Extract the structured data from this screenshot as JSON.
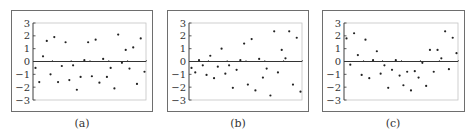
{
  "chart_data": [
    {
      "type": "scatter",
      "title": "",
      "caption": "(a)",
      "xlabel": "",
      "ylabel": "",
      "ylim": [
        -3,
        3
      ],
      "yticks": [
        3,
        2,
        1,
        0,
        -1,
        -2,
        -3
      ],
      "ytick_labels": [
        "3",
        "2",
        "1",
        "0",
        "−1",
        "−2",
        "−3"
      ],
      "x": [
        1,
        2,
        3,
        4,
        5,
        6,
        7,
        8,
        9,
        10,
        11,
        12,
        13,
        14,
        15,
        16,
        17,
        18,
        19,
        20,
        21,
        22,
        23,
        24,
        25,
        26,
        27,
        28,
        29,
        30
      ],
      "values": [
        -0.5,
        -1.6,
        0.4,
        1.6,
        -1.0,
        1.9,
        -1.6,
        -0.35,
        1.5,
        -1.45,
        -0.3,
        -2.2,
        -1.2,
        0.1,
        1.5,
        -1.15,
        1.7,
        -1.65,
        0.2,
        -1.2,
        -0.5,
        -2.1,
        2.1,
        -0.1,
        0.9,
        -0.55,
        1.1,
        -1.75,
        1.8,
        -0.8
      ],
      "zero_line": true,
      "grid": false
    },
    {
      "type": "scatter",
      "title": "",
      "caption": "(b)",
      "xlabel": "",
      "ylabel": "",
      "ylim": [
        -3,
        3
      ],
      "yticks": [
        3,
        2,
        1,
        0,
        -1,
        -2,
        -3
      ],
      "ytick_labels": [
        "3",
        "2",
        "1",
        "0",
        "−1",
        "−2",
        "−3"
      ],
      "x": [
        1,
        2,
        3,
        4,
        5,
        6,
        7,
        8,
        9,
        10,
        11,
        12,
        13,
        14,
        15,
        16,
        17,
        18,
        19,
        20,
        21,
        22,
        23,
        24,
        25,
        26,
        27,
        28,
        29,
        30
      ],
      "values": [
        -0.5,
        -0.85,
        0.1,
        -0.3,
        -1.05,
        0.45,
        -1.3,
        -0.4,
        1.0,
        -0.95,
        -0.3,
        -2.05,
        -0.65,
        0.1,
        1.4,
        -1.8,
        1.75,
        -2.25,
        0.2,
        -1.25,
        -0.55,
        -2.65,
        2.35,
        -0.85,
        0.9,
        0.25,
        2.35,
        -1.8,
        1.85,
        -2.35
      ],
      "zero_line": true,
      "grid": false
    },
    {
      "type": "scatter",
      "title": "",
      "caption": "(c)",
      "xlabel": "",
      "ylabel": "",
      "ylim": [
        -3,
        3
      ],
      "yticks": [
        3,
        2,
        1,
        0,
        -1,
        -2,
        -3
      ],
      "ytick_labels": [
        "3",
        "2",
        "1",
        "0",
        "−1",
        "−2",
        "−3"
      ],
      "x": [
        1,
        2,
        3,
        4,
        5,
        6,
        7,
        8,
        9,
        10,
        11,
        12,
        13,
        14,
        15,
        16,
        17,
        18,
        19,
        20,
        21,
        22,
        23,
        24,
        25,
        26,
        27,
        28,
        29,
        30
      ],
      "values": [
        1.8,
        -0.25,
        2.2,
        0.5,
        -1.05,
        1.7,
        -1.3,
        0.1,
        0.8,
        -0.95,
        -0.3,
        -2.05,
        -0.65,
        0.1,
        -1.1,
        -1.85,
        -0.8,
        -2.25,
        -0.75,
        -1.25,
        -0.1,
        -1.9,
        0.9,
        -0.8,
        0.9,
        0.25,
        2.35,
        -0.6,
        1.85,
        0.65
      ],
      "zero_line": true,
      "grid": false
    }
  ],
  "layout": {
    "panels": [
      {
        "frame": [
          11,
          10,
          142,
          102
        ],
        "plot": [
          33,
          23,
          113,
          77
        ],
        "caption_x": 82
      },
      {
        "frame": [
          167,
          10,
          142,
          102
        ],
        "plot": [
          189,
          23,
          113,
          77
        ],
        "caption_x": 238
      },
      {
        "frame": [
          322,
          10,
          143,
          102
        ],
        "plot": [
          344,
          23,
          114,
          77
        ],
        "caption_x": 393
      }
    ],
    "colors": {
      "frame": "#6e6e6e",
      "plot_border": "#c4c4c4",
      "axis": "#333333",
      "points": "#222222",
      "text": "#333333"
    }
  }
}
